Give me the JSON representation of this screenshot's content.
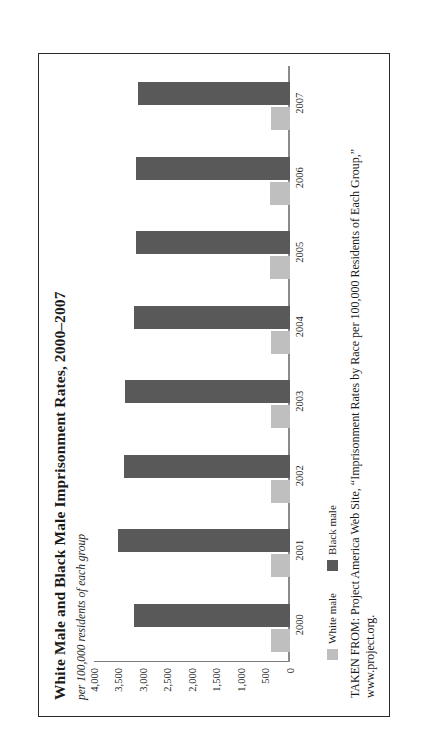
{
  "figure": {
    "title": "White Male and Black Male Imprisonment Rates, 2000–2007",
    "subtitle": "per 100,000 residents of each group",
    "source_note": "TAKEN FROM: Project America Web Site, “Imprisonment Rates by Race per 100,000 Residents of Each Group,”",
    "source_url": "www.project.org."
  },
  "legend": {
    "position": "bottom-left",
    "items": [
      {
        "label": "White male",
        "color": "#bfbfbf"
      },
      {
        "label": "Black male",
        "color": "#595959"
      }
    ]
  },
  "colors": {
    "white_male": "#bfbfbf",
    "black_male": "#595959",
    "axis": "#8a8a8a",
    "border": "#2a2a2a",
    "text": "#1a1a1a"
  },
  "chart_data": {
    "type": "bar",
    "title": "White Male and Black Male Imprisonment Rates, 2000–2007",
    "subtitle": "per 100,000 residents of each group",
    "xlabel": "",
    "ylabel": "per 100,000 residents of each group",
    "ylim": [
      0,
      4000
    ],
    "yticks": [
      4000,
      3500,
      3000,
      2500,
      2000,
      1500,
      1000,
      500,
      0
    ],
    "ytick_labels": [
      "4,000",
      "3,500",
      "3,000",
      "2,500",
      "2,000",
      "1,500",
      "1,000",
      "500",
      "0"
    ],
    "grid": false,
    "orientation": "vertical",
    "categories": [
      "2000",
      "2001",
      "2002",
      "2003",
      "2004",
      "2005",
      "2006",
      "2007"
    ],
    "series": [
      {
        "name": "White male",
        "color": "#bfbfbf",
        "values": [
          375,
          385,
          380,
          385,
          390,
          400,
          405,
          390
        ]
      },
      {
        "name": "Black male",
        "color": "#595959",
        "values": [
          3185,
          3510,
          3380,
          3360,
          3180,
          3130,
          3130,
          3090
        ]
      }
    ]
  }
}
